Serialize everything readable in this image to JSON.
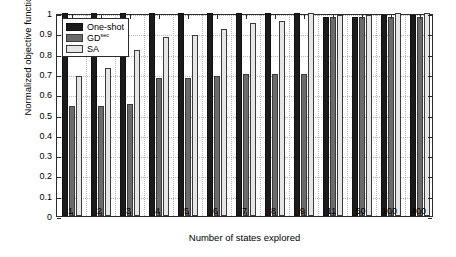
{
  "chart_data": {
    "type": "bar",
    "title": "",
    "xlabel": "Number of states explored",
    "ylabel": "Normalized objective function",
    "categories": [
      "1",
      "2",
      "3",
      "4",
      "5",
      "6",
      "7",
      "8",
      "9",
      "11",
      "50",
      "100",
      "400"
    ],
    "ylim": [
      0,
      1
    ],
    "yticks": [
      "0",
      "0.1",
      "0.2",
      "0.3",
      "0.4",
      "0.5",
      "0.6",
      "0.7",
      "0.8",
      "0.9",
      "1"
    ],
    "grid": true,
    "legend_position": "upper-left",
    "series": [
      {
        "name": "One-shot",
        "superscript": "",
        "color": "#1b1b1b",
        "values": [
          1.0,
          1.0,
          1.0,
          1.0,
          1.0,
          1.0,
          1.0,
          1.0,
          1.0,
          0.98,
          0.98,
          0.99,
          0.99
        ]
      },
      {
        "name": "GD",
        "superscript": "sec",
        "color": "#6b6b6b",
        "values": [
          0.54,
          0.54,
          0.55,
          0.68,
          0.68,
          0.69,
          0.7,
          0.7,
          0.7,
          0.98,
          0.98,
          0.98,
          0.98
        ]
      },
      {
        "name": "SA",
        "superscript": "",
        "color": "#e6e6e6",
        "values": [
          0.69,
          0.73,
          0.82,
          0.88,
          0.89,
          0.92,
          0.95,
          0.96,
          1.0,
          0.99,
          0.99,
          1.0,
          1.0
        ]
      }
    ]
  },
  "legend": {
    "items": [
      {
        "label": "One-shot",
        "sup": ""
      },
      {
        "label": "GD",
        "sup": "sec"
      },
      {
        "label": "SA",
        "sup": ""
      }
    ]
  }
}
